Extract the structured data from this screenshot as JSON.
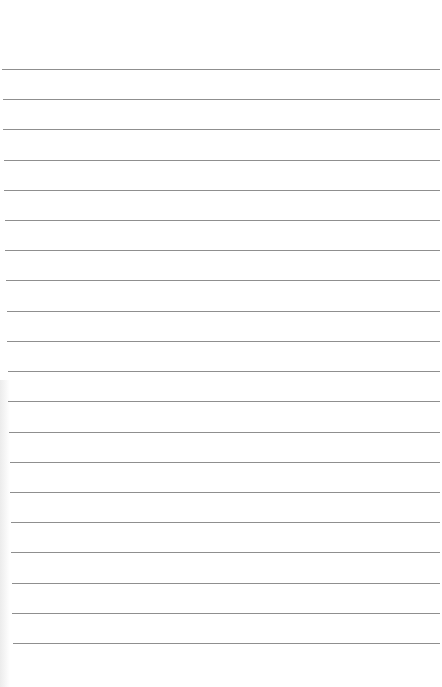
{
  "document": {
    "type": "lined-paper",
    "title": "",
    "body_text": "",
    "rule_count": 20,
    "rule_color": "#8f8f8f",
    "background_color": "#ffffff"
  }
}
